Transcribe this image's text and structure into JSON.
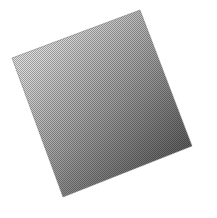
{
  "image": {
    "title": "Gradient Square",
    "description": "Scanned halftone print of a tilted square filled with a linear grayscale gradient",
    "width": 217,
    "height": 218,
    "background_color": "#ffffff"
  },
  "shape": {
    "name": "tilted-square",
    "type": "quadrilateral",
    "rotation_degrees": 21,
    "corners": {
      "top": {
        "x": 140,
        "y": 10
      },
      "left": {
        "x": 12,
        "y": 58
      },
      "bottom": {
        "x": 63,
        "y": 197
      },
      "right": {
        "x": 192,
        "y": 146
      }
    },
    "polygon_points": "140,10 192,146 63,197 12,58",
    "edge_color": "#8c8c8c"
  },
  "gradient": {
    "name": "diagonal-gray-gradient",
    "direction": "top-left to bottom-right",
    "angle_degrees": 110,
    "stops": [
      {
        "offset": "0%",
        "color": "#f2f2f2",
        "label": "lightest"
      },
      {
        "offset": "22%",
        "color": "#d8d8d8",
        "label": "light"
      },
      {
        "offset": "48%",
        "color": "#a8a8a8",
        "label": "mid"
      },
      {
        "offset": "74%",
        "color": "#767676",
        "label": "dark"
      },
      {
        "offset": "100%",
        "color": "#454545",
        "label": "darkest"
      }
    ]
  },
  "texture": {
    "name": "halftone-dither",
    "pattern": "checkerboard",
    "cell_size_px": 2,
    "dot_color": "#7a7a7a",
    "opacity": 0.55
  }
}
